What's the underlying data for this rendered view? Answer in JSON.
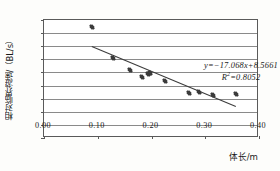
{
  "chart_data": {
    "type": "scatter",
    "title": "",
    "xlabel": "体长/m",
    "ylabel": "相对临界游速/（BL/s）",
    "xlim": [
      0.0,
      0.4
    ],
    "ylim": [
      0.0,
      9.0
    ],
    "xticks": [
      "0.00",
      "0.10",
      "0.20",
      "0.30",
      "0.40"
    ],
    "xtick_values": [
      0.0,
      0.1,
      0.2,
      0.3,
      0.4
    ],
    "yticks": [
      "0.00",
      "1.00",
      "2.00",
      "3.00",
      "4.00",
      "5.00",
      "6.00",
      "7.00",
      "8.00",
      "9.00"
    ],
    "ytick_values": [
      0.0,
      1.0,
      2.0,
      3.0,
      4.0,
      5.0,
      6.0,
      7.0,
      8.0,
      9.0
    ],
    "grid": "horizontal",
    "legend": "none",
    "marker": "diamond",
    "marker_color": "#3b3b3b",
    "points": [
      {
        "x": 0.09,
        "y": 8.45
      },
      {
        "x": 0.128,
        "y": 6.12
      },
      {
        "x": 0.16,
        "y": 5.18
      },
      {
        "x": 0.182,
        "y": 4.62
      },
      {
        "x": 0.193,
        "y": 4.88
      },
      {
        "x": 0.198,
        "y": 4.92
      },
      {
        "x": 0.226,
        "y": 4.35
      },
      {
        "x": 0.27,
        "y": 3.45
      },
      {
        "x": 0.288,
        "y": 3.52
      },
      {
        "x": 0.315,
        "y": 3.27
      },
      {
        "x": 0.357,
        "y": 3.33
      }
    ],
    "trendline": {
      "slope": -17.068,
      "intercept": 8.5661,
      "r_squared": 0.8052,
      "x_start": 0.09,
      "x_end": 0.358,
      "color": "#3b3b3b"
    },
    "annotations": {
      "equation": "y=−17.068x+8.5661",
      "r_squared_label": "R",
      "r_squared_exp": "2",
      "r_squared_value": "=0.8052"
    }
  }
}
